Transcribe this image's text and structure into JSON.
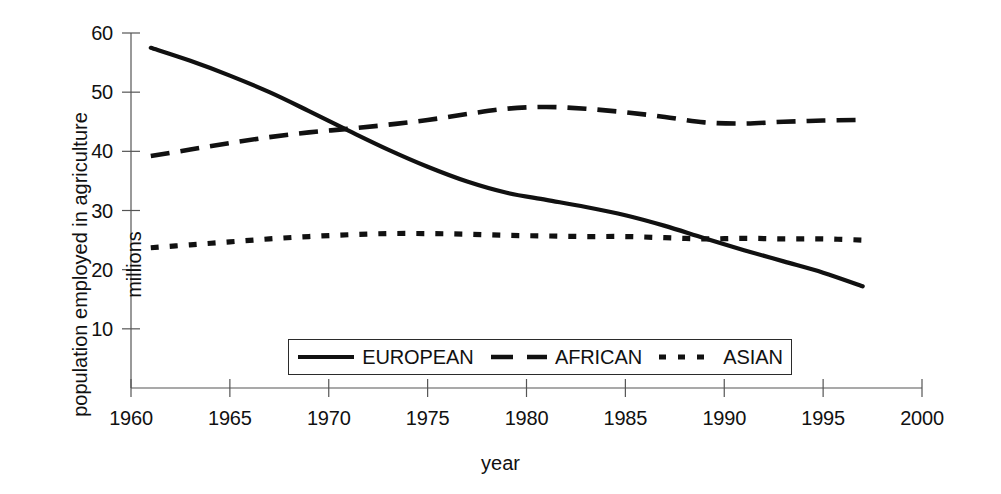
{
  "chart_data": {
    "type": "line",
    "title": "",
    "xlabel": "year",
    "ylabel": "population employed in agriculture\nmillions",
    "ylabel_line1": "population employed in agriculture",
    "ylabel_line2": "millions",
    "xlim": [
      1960,
      2000
    ],
    "ylim": [
      0,
      60
    ],
    "xticks": [
      1960,
      1965,
      1970,
      1975,
      1980,
      1985,
      1990,
      1995,
      2000
    ],
    "yticks": [
      10,
      20,
      30,
      40,
      50,
      60
    ],
    "xtick_labels": [
      "1960",
      "1965",
      "1970",
      "1975",
      "1980",
      "1985",
      "1990",
      "1995",
      "2000"
    ],
    "ytick_labels": [
      "10",
      "20",
      "30",
      "40",
      "50",
      "60"
    ],
    "grid": false,
    "legend_position": "lower-center-inside",
    "line_color": "#111111",
    "series": [
      {
        "name": "EUROPEAN",
        "style": "solid",
        "x": [
          1961,
          1963,
          1965,
          1967,
          1969,
          1971,
          1973,
          1975,
          1977,
          1979,
          1981,
          1983,
          1985,
          1987,
          1989,
          1991,
          1993,
          1995,
          1997
        ],
        "values": [
          57.5,
          55.3,
          52.8,
          50.0,
          46.8,
          43.5,
          40.3,
          37.4,
          34.9,
          33.0,
          31.8,
          30.6,
          29.2,
          27.4,
          25.3,
          23.3,
          21.4,
          19.5,
          17.2
        ]
      },
      {
        "name": "AFRICAN",
        "style": "dashed",
        "x": [
          1961,
          1963,
          1965,
          1967,
          1969,
          1971,
          1973,
          1975,
          1977,
          1979,
          1981,
          1983,
          1985,
          1987,
          1989,
          1991,
          1993,
          1995,
          1997
        ],
        "values": [
          39.2,
          40.3,
          41.4,
          42.4,
          43.2,
          43.8,
          44.5,
          45.3,
          46.3,
          47.2,
          47.5,
          47.2,
          46.6,
          45.8,
          44.9,
          44.7,
          45.0,
          45.2,
          45.3
        ]
      },
      {
        "name": "ASIAN",
        "style": "dotted",
        "x": [
          1961,
          1963,
          1965,
          1967,
          1969,
          1971,
          1973,
          1975,
          1977,
          1979,
          1981,
          1983,
          1985,
          1987,
          1989,
          1991,
          1993,
          1995,
          1997
        ],
        "values": [
          23.7,
          24.2,
          24.7,
          25.2,
          25.6,
          25.9,
          26.1,
          26.1,
          26.0,
          25.8,
          25.7,
          25.6,
          25.6,
          25.4,
          25.2,
          25.3,
          25.2,
          25.2,
          25.0
        ]
      }
    ]
  }
}
